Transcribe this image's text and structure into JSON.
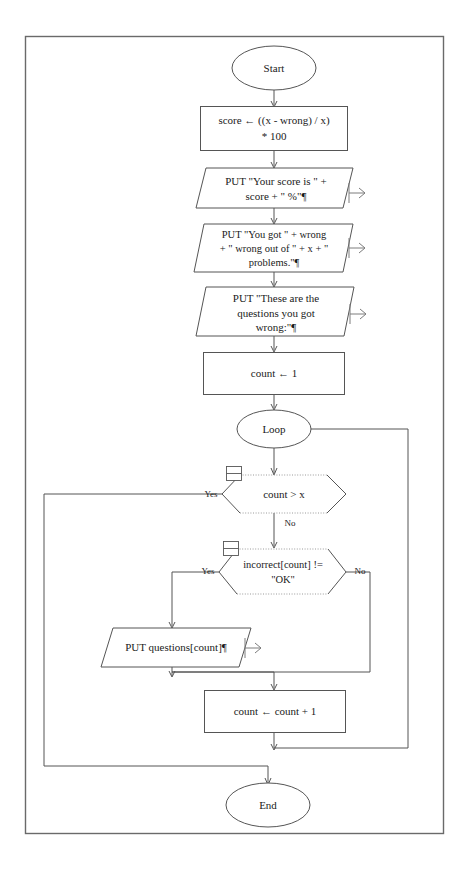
{
  "diagram": {
    "frame_color": "#6a6a6a",
    "shape_stroke_color": "#555555",
    "dotted_edge_color": "#9a9a9a"
  },
  "nodes": {
    "start": {
      "label": "Start",
      "shape": "terminator-ellipse"
    },
    "score_calc": {
      "line1": "score ← ((x - wrong) / x)",
      "line2": "* 100",
      "shape": "process-rect"
    },
    "put_score": {
      "line1": "PUT \"Your score is \" +",
      "line2": "score + \" %\"¶",
      "shape": "output-parallelogram"
    },
    "put_wrong": {
      "line1": "PUT \"You got \" + wrong",
      "line2": "+ \" wrong out of \" + x + \"",
      "line3": "problems.\"¶",
      "shape": "output-parallelogram"
    },
    "put_these": {
      "line1": "PUT \"These are the",
      "line2": "questions you got",
      "line3": "wrong:\"¶",
      "shape": "output-parallelogram"
    },
    "count_init": {
      "label": "count ← 1",
      "shape": "process-rect"
    },
    "loop": {
      "label": "Loop",
      "shape": "loop-ellipse"
    },
    "decision_count": {
      "label": "count > x",
      "shape": "decision-hexagon"
    },
    "decision_incorrect": {
      "line1": "incorrect[count] !=",
      "line2": "\"OK\"",
      "shape": "decision-hexagon"
    },
    "put_question": {
      "label": "PUT questions[count]¶",
      "shape": "output-parallelogram"
    },
    "count_inc": {
      "label": "count ← count + 1",
      "shape": "process-rect"
    },
    "end": {
      "label": "End",
      "shape": "terminator-ellipse"
    }
  },
  "edge_labels": {
    "count_yes": "Yes",
    "count_no": "No",
    "incorrect_yes": "Yes",
    "incorrect_no": "No"
  },
  "icons": {
    "note_decision_1": "note-icon",
    "note_decision_2": "note-icon",
    "output_arrow_1": "output-arrow-icon",
    "output_arrow_2": "output-arrow-icon",
    "output_arrow_3": "output-arrow-icon",
    "output_arrow_4": "output-arrow-icon"
  }
}
